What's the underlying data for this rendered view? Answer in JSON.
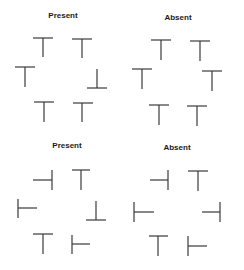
{
  "panels": [
    {
      "title": "Present",
      "title_pos": [
        63,
        11
      ]
    },
    {
      "title": "Absent",
      "title_pos": [
        178,
        13
      ]
    },
    {
      "title": "Present",
      "title_pos": [
        67,
        141
      ]
    },
    {
      "title": "Absent",
      "title_pos": [
        177,
        143
      ]
    }
  ],
  "stroke_color": "#3a3a3a",
  "shapes": [
    {
      "panel": 0,
      "type": "T",
      "lines": [
        [
          33,
          38,
          53,
          38
        ],
        [
          43,
          38,
          43,
          57
        ]
      ]
    },
    {
      "panel": 0,
      "type": "T",
      "lines": [
        [
          72,
          39,
          92,
          39
        ],
        [
          82,
          39,
          82,
          58
        ]
      ]
    },
    {
      "panel": 0,
      "type": "T",
      "lines": [
        [
          15,
          67,
          35,
          67
        ],
        [
          25,
          67,
          25,
          87
        ]
      ]
    },
    {
      "panel": 0,
      "type": "inverted-T",
      "lines": [
        [
          97,
          69,
          97,
          88
        ],
        [
          87,
          88,
          107,
          88
        ]
      ]
    },
    {
      "panel": 0,
      "type": "T",
      "lines": [
        [
          34,
          102,
          54,
          102
        ],
        [
          44,
          102,
          44,
          122
        ]
      ]
    },
    {
      "panel": 0,
      "type": "T",
      "lines": [
        [
          73,
          103,
          93,
          103
        ],
        [
          82,
          103,
          82,
          122
        ]
      ]
    },
    {
      "panel": 1,
      "type": "T",
      "lines": [
        [
          151,
          40,
          171,
          40
        ],
        [
          161,
          40,
          161,
          60
        ]
      ]
    },
    {
      "panel": 1,
      "type": "T",
      "lines": [
        [
          190,
          41,
          210,
          41
        ],
        [
          200,
          41,
          200,
          61
        ]
      ]
    },
    {
      "panel": 1,
      "type": "T",
      "lines": [
        [
          132,
          69,
          152,
          69
        ],
        [
          142,
          69,
          142,
          89
        ]
      ]
    },
    {
      "panel": 1,
      "type": "T",
      "lines": [
        [
          202,
          71,
          222,
          71
        ],
        [
          212,
          71,
          212,
          91
        ]
      ]
    },
    {
      "panel": 1,
      "type": "T",
      "lines": [
        [
          149,
          105,
          169,
          105
        ],
        [
          159,
          105,
          159,
          125
        ]
      ]
    },
    {
      "panel": 1,
      "type": "T",
      "lines": [
        [
          187,
          106,
          207,
          106
        ],
        [
          197,
          106,
          197,
          126
        ]
      ]
    },
    {
      "panel": 2,
      "type": "T-left",
      "lines": [
        [
          33,
          180,
          52,
          180
        ],
        [
          52,
          170,
          52,
          190
        ]
      ]
    },
    {
      "panel": 2,
      "type": "T",
      "lines": [
        [
          72,
          170,
          90,
          170
        ],
        [
          81,
          170,
          81,
          190
        ]
      ]
    },
    {
      "panel": 2,
      "type": "T-right",
      "lines": [
        [
          18,
          199,
          18,
          218
        ],
        [
          18,
          208,
          37,
          208
        ]
      ]
    },
    {
      "panel": 2,
      "type": "inverted-T",
      "lines": [
        [
          96,
          201,
          96,
          220
        ],
        [
          86,
          220,
          106,
          220
        ]
      ]
    },
    {
      "panel": 2,
      "type": "T",
      "lines": [
        [
          33,
          234,
          53,
          234
        ],
        [
          43,
          234,
          43,
          254
        ]
      ]
    },
    {
      "panel": 2,
      "type": "T-right",
      "lines": [
        [
          72,
          235,
          72,
          254
        ],
        [
          72,
          244,
          90,
          244
        ]
      ]
    },
    {
      "panel": 3,
      "type": "T-left",
      "lines": [
        [
          150,
          180,
          168,
          180
        ],
        [
          168,
          170,
          168,
          190
        ]
      ]
    },
    {
      "panel": 3,
      "type": "T",
      "lines": [
        [
          188,
          171,
          208,
          171
        ],
        [
          198,
          171,
          198,
          191
        ]
      ]
    },
    {
      "panel": 3,
      "type": "T-right",
      "lines": [
        [
          134,
          202,
          134,
          222
        ],
        [
          134,
          212,
          154,
          212
        ]
      ]
    },
    {
      "panel": 3,
      "type": "T-left",
      "lines": [
        [
          202,
          212,
          220,
          212
        ],
        [
          220,
          202,
          220,
          222
        ]
      ]
    },
    {
      "panel": 3,
      "type": "T",
      "lines": [
        [
          149,
          236,
          168,
          236
        ],
        [
          158,
          236,
          158,
          256
        ]
      ]
    },
    {
      "panel": 3,
      "type": "T-right",
      "lines": [
        [
          188,
          236,
          188,
          256
        ],
        [
          188,
          246,
          207,
          246
        ]
      ]
    }
  ]
}
